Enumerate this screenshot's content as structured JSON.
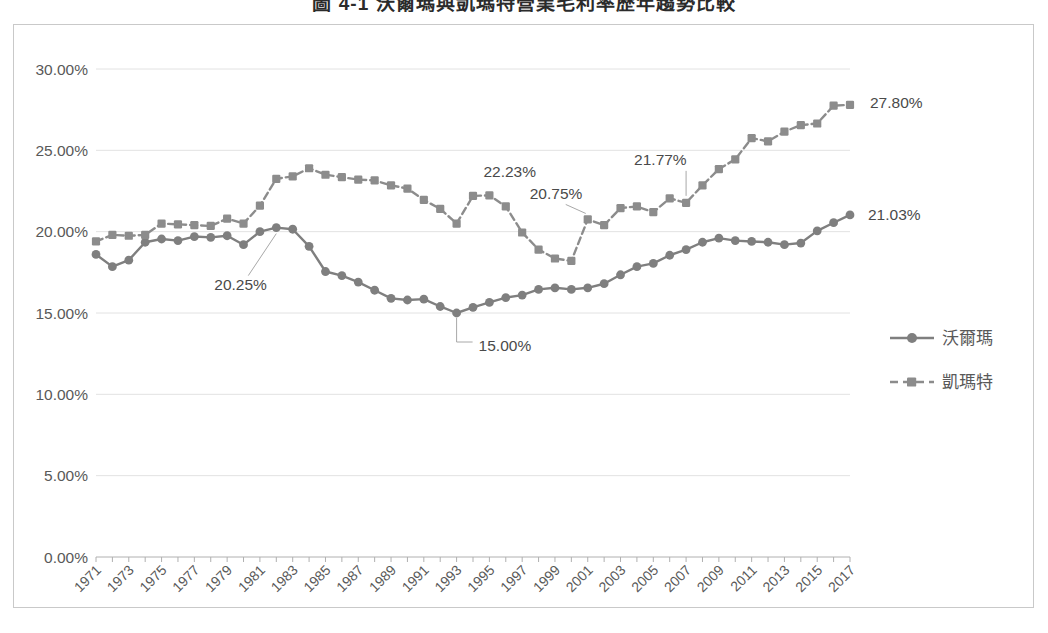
{
  "title": "圖 4-1  沃爾瑪與凱瑪特營業毛利率歷年趨勢比較",
  "legend": {
    "position": "right",
    "items": [
      {
        "label": "沃爾瑪",
        "marker": "circle",
        "line": "solid",
        "color": "#7f7f7f"
      },
      {
        "label": "凱瑪特",
        "marker": "square",
        "line": "dashed",
        "color": "#8c8c8c"
      }
    ]
  },
  "yaxis": {
    "ticks": [
      "0.00%",
      "5.00%",
      "10.00%",
      "15.00%",
      "20.00%",
      "25.00%",
      "30.00%"
    ],
    "min": 0,
    "max": 30,
    "step": 5
  },
  "xaxis": {
    "ticks": [
      "1971",
      "1973",
      "1975",
      "1977",
      "1979",
      "1981",
      "1983",
      "1985",
      "1987",
      "1989",
      "1991",
      "1993",
      "1995",
      "1997",
      "1999",
      "2001",
      "2003",
      "2005",
      "2007",
      "2009",
      "2011",
      "2013",
      "2015",
      "2017"
    ],
    "min": 1971,
    "max": 2017
  },
  "annotations": [
    {
      "text": "20.25%",
      "series": "沃爾瑪",
      "year": 1982,
      "value": 20.25
    },
    {
      "text": "15.00%",
      "series": "沃爾瑪",
      "year": 1993,
      "value": 15.0
    },
    {
      "text": "21.03%",
      "series": "沃爾瑪",
      "year": 2017,
      "value": 21.03
    },
    {
      "text": "22.23%",
      "series": "凱瑪特",
      "year": 1995,
      "value": 22.23
    },
    {
      "text": "20.75%",
      "series": "凱瑪特",
      "year": 2001,
      "value": 20.75
    },
    {
      "text": "21.77%",
      "series": "凱瑪特",
      "year": 2007,
      "value": 21.77
    },
    {
      "text": "27.80%",
      "series": "凱瑪特",
      "year": 2017,
      "value": 27.8
    }
  ],
  "chart_data": {
    "type": "line",
    "title": "圖 4-1  沃爾瑪與凱瑪特營業毛利率歷年趨勢比較",
    "xlabel": "",
    "ylabel": "",
    "ylim": [
      0,
      30
    ],
    "ytick_format": "percent",
    "grid": true,
    "legend_position": "right",
    "x": [
      1971,
      1972,
      1973,
      1974,
      1975,
      1976,
      1977,
      1978,
      1979,
      1980,
      1981,
      1982,
      1983,
      1984,
      1985,
      1986,
      1987,
      1988,
      1989,
      1990,
      1991,
      1992,
      1993,
      1994,
      1995,
      1996,
      1997,
      1998,
      1999,
      2000,
      2001,
      2002,
      2003,
      2004,
      2005,
      2006,
      2007,
      2008,
      2009,
      2010,
      2011,
      2012,
      2013,
      2014,
      2015,
      2016,
      2017
    ],
    "series": [
      {
        "name": "沃爾瑪",
        "marker": "circle",
        "line": "solid",
        "color": "#7f7f7f",
        "values": [
          18.6,
          17.85,
          18.25,
          19.35,
          19.55,
          19.45,
          19.7,
          19.65,
          19.75,
          19.2,
          20.0,
          20.25,
          20.15,
          19.1,
          17.55,
          17.3,
          16.9,
          16.4,
          15.9,
          15.8,
          15.85,
          15.4,
          15.0,
          15.35,
          15.65,
          15.95,
          16.1,
          16.45,
          16.55,
          16.45,
          16.55,
          16.8,
          17.35,
          17.85,
          18.05,
          18.55,
          18.9,
          19.35,
          19.6,
          19.45,
          19.4,
          19.35,
          19.2,
          19.3,
          20.05,
          20.55,
          21.03
        ]
      },
      {
        "name": "凱瑪特",
        "marker": "square",
        "line": "dashed",
        "color": "#8c8c8c",
        "values": [
          19.4,
          19.8,
          19.75,
          19.8,
          20.5,
          20.45,
          20.4,
          20.35,
          20.8,
          20.5,
          21.6,
          23.25,
          23.4,
          23.9,
          23.5,
          23.35,
          23.2,
          23.15,
          22.85,
          22.65,
          21.95,
          21.4,
          20.5,
          22.2,
          22.23,
          21.55,
          19.95,
          18.9,
          18.35,
          18.2,
          20.75,
          20.4,
          21.45,
          21.55,
          21.2,
          22.05,
          21.77,
          22.85,
          23.85,
          24.45,
          25.75,
          25.55,
          26.15,
          26.55,
          26.65,
          27.75,
          27.8
        ]
      }
    ]
  }
}
